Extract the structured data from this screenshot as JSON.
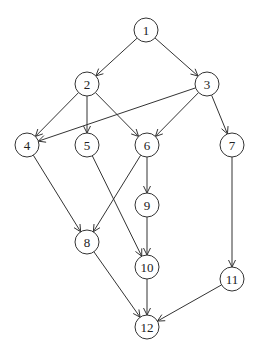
{
  "diagram": {
    "type": "directed-acyclic-graph",
    "node_radius": 12,
    "colors": {
      "stroke": "#333333",
      "fill": "#ffffff",
      "text": "#222222",
      "background": "#ffffff"
    },
    "nodes": [
      {
        "id": "1",
        "label": "1",
        "x": 146,
        "y": 30
      },
      {
        "id": "2",
        "label": "2",
        "x": 87,
        "y": 84
      },
      {
        "id": "3",
        "label": "3",
        "x": 207,
        "y": 84
      },
      {
        "id": "4",
        "label": "4",
        "x": 27,
        "y": 145
      },
      {
        "id": "5",
        "label": "5",
        "x": 87,
        "y": 145
      },
      {
        "id": "6",
        "label": "6",
        "x": 147,
        "y": 145
      },
      {
        "id": "7",
        "label": "7",
        "x": 232,
        "y": 145
      },
      {
        "id": "9",
        "label": "9",
        "x": 147,
        "y": 205
      },
      {
        "id": "8",
        "label": "8",
        "x": 87,
        "y": 242
      },
      {
        "id": "10",
        "label": "10",
        "x": 147,
        "y": 267
      },
      {
        "id": "11",
        "label": "11",
        "x": 232,
        "y": 279
      },
      {
        "id": "12",
        "label": "12",
        "x": 147,
        "y": 327
      }
    ],
    "edges": [
      {
        "from": "1",
        "to": "2"
      },
      {
        "from": "1",
        "to": "3"
      },
      {
        "from": "2",
        "to": "4"
      },
      {
        "from": "2",
        "to": "5"
      },
      {
        "from": "2",
        "to": "6"
      },
      {
        "from": "3",
        "to": "4"
      },
      {
        "from": "3",
        "to": "6"
      },
      {
        "from": "3",
        "to": "7"
      },
      {
        "from": "4",
        "to": "8"
      },
      {
        "from": "5",
        "to": "10"
      },
      {
        "from": "6",
        "to": "8"
      },
      {
        "from": "6",
        "to": "9"
      },
      {
        "from": "9",
        "to": "10"
      },
      {
        "from": "7",
        "to": "11"
      },
      {
        "from": "8",
        "to": "12"
      },
      {
        "from": "10",
        "to": "12"
      },
      {
        "from": "11",
        "to": "12"
      }
    ]
  }
}
